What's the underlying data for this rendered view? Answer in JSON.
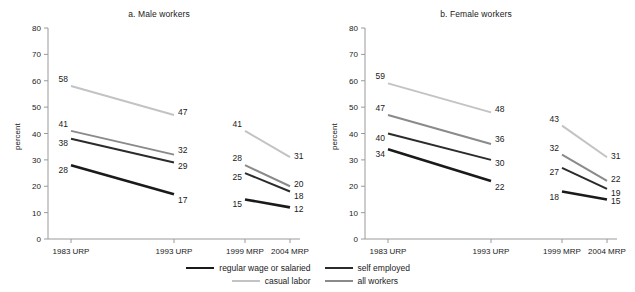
{
  "chart_data": [
    {
      "type": "line",
      "title": "a. Male workers",
      "xlabel": "",
      "ylabel": "percent",
      "ylim": [
        0,
        80
      ],
      "ytick_step": 10,
      "yticks": [
        0,
        10,
        20,
        30,
        40,
        50,
        60,
        70,
        80
      ],
      "categories": [
        "1983 URP",
        "1993 URP",
        "1999 MRP",
        "2004 MRP"
      ],
      "grid": false,
      "legend_position": "bottom",
      "segments": [
        "URP",
        "MRP"
      ],
      "series": [
        {
          "name": "regular wage or salaried",
          "color": "#1a1a1a",
          "width": 2.6,
          "values": [
            28,
            17,
            15,
            12
          ]
        },
        {
          "name": "self employed",
          "color": "#2b2b2b",
          "width": 2.0,
          "values": [
            38,
            29,
            25,
            18
          ]
        },
        {
          "name": "casual labor",
          "color": "#c3c3c3",
          "width": 2.0,
          "values": [
            58,
            47,
            41,
            31
          ]
        },
        {
          "name": "all workers",
          "color": "#8a8a8a",
          "width": 2.0,
          "values": [
            41,
            32,
            28,
            20
          ]
        }
      ]
    },
    {
      "type": "line",
      "title": "b. Female workers",
      "xlabel": "",
      "ylabel": "percent",
      "ylim": [
        0,
        80
      ],
      "ytick_step": 10,
      "yticks": [
        0,
        10,
        20,
        30,
        40,
        50,
        60,
        70,
        80
      ],
      "categories": [
        "1983 URP",
        "1993 URP",
        "1999 MRP",
        "2004 MRP"
      ],
      "grid": false,
      "legend_position": "bottom",
      "segments": [
        "URP",
        "MRP"
      ],
      "series": [
        {
          "name": "regular wage or salaried",
          "color": "#1a1a1a",
          "width": 2.6,
          "values": [
            34,
            22,
            18,
            15
          ]
        },
        {
          "name": "self employed",
          "color": "#2b2b2b",
          "width": 2.0,
          "values": [
            40,
            30,
            27,
            19
          ]
        },
        {
          "name": "casual labor",
          "color": "#c3c3c3",
          "width": 2.0,
          "values": [
            59,
            48,
            43,
            31
          ]
        },
        {
          "name": "all workers",
          "color": "#8a8a8a",
          "width": 2.0,
          "values": [
            47,
            36,
            32,
            22
          ]
        }
      ]
    }
  ],
  "panels": [
    {
      "id": "male",
      "title": "a. Male workers",
      "ylabel": "percent",
      "yticks": [
        "80",
        "70",
        "60",
        "50",
        "40",
        "30",
        "20",
        "10",
        "0"
      ],
      "xticks": [
        "1983 URP",
        "1993 URP",
        "1999 MRP",
        "2004 MRP"
      ],
      "point_labels": {
        "casual": [
          "58",
          "47",
          "41",
          "31"
        ],
        "all": [
          "41",
          "32",
          "28",
          "20"
        ],
        "self": [
          "38",
          "29",
          "25",
          "18"
        ],
        "regular": [
          "28",
          "17",
          "15",
          "12"
        ]
      }
    },
    {
      "id": "female",
      "title": "b. Female workers",
      "ylabel": "percent",
      "yticks": [
        "80",
        "70",
        "60",
        "50",
        "40",
        "30",
        "20",
        "10",
        "0"
      ],
      "xticks": [
        "1983 URP",
        "1993 URP",
        "1999 MRP",
        "2004 MRP"
      ],
      "point_labels": {
        "casual": [
          "59",
          "48",
          "43",
          "31"
        ],
        "all": [
          "47",
          "36",
          "32",
          "22"
        ],
        "self": [
          "40",
          "30",
          "27",
          "19"
        ],
        "regular": [
          "34",
          "22",
          "18",
          "15"
        ]
      }
    }
  ],
  "legend": {
    "rows": [
      [
        {
          "label": "regular wage or salaried",
          "color": "#1a1a1a",
          "width": "2.6px"
        },
        {
          "label": "self employed",
          "color": "#2b2b2b",
          "width": "2.2px"
        }
      ],
      [
        {
          "label": "casual labor",
          "color": "#c3c3c3",
          "width": "2.0px"
        },
        {
          "label": "all workers",
          "color": "#8a8a8a",
          "width": "2.0px"
        }
      ]
    ]
  },
  "colors": {
    "regular_wage": "#1a1a1a",
    "self_employed": "#2b2b2b",
    "casual_labor": "#c3c3c3",
    "all_workers": "#8a8a8a",
    "axis": "#9a9a9a",
    "text": "#1a1a1a"
  }
}
